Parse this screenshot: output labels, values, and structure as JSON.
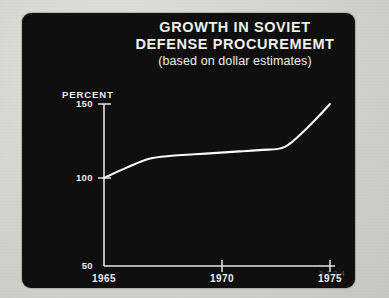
{
  "card": {
    "background_color": "#0b0b0b",
    "foreground_color": "#f2f2ef"
  },
  "title": {
    "line1": "GROWTH IN SOVIET",
    "line2": "DEFENSE PROCUREMEMT",
    "subtitle": "(based on dollar estimates)"
  },
  "axis_label": {
    "y": "PERCENT"
  },
  "artifact": {
    "scan_stamp": "3-1-2-4"
  },
  "chart_data": {
    "type": "line",
    "title": "GROWTH IN SOVIET DEFENSE PROCUREMEMT",
    "subtitle": "(based on dollar estimates)",
    "xlabel": "",
    "ylabel": "PERCENT",
    "xlim": [
      1965,
      1975.2
    ],
    "ylim": [
      50,
      155
    ],
    "grid": false,
    "legend": null,
    "ytick_labels": [
      "150",
      "100",
      "50"
    ],
    "yticks": [
      150,
      100,
      50
    ],
    "xtick_labels": [
      "1965",
      "1970",
      "1975"
    ],
    "xticks": [
      1965,
      1970,
      1975
    ],
    "line_color": "#fbfbf8",
    "series": [
      {
        "name": "Soviet defense procurement index",
        "x": [
          1965,
          1966,
          1967,
          1968,
          1969,
          1970,
          1971,
          1972,
          1973,
          1974,
          1975
        ],
        "values": [
          100,
          107,
          113,
          115,
          116,
          117,
          118,
          119,
          121,
          134,
          150
        ]
      }
    ]
  }
}
